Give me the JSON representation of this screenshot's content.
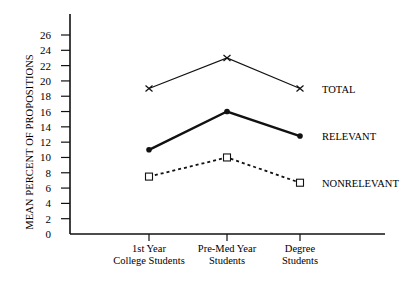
{
  "chart_data": {
    "type": "line",
    "title": "",
    "xlabel": "",
    "ylabel": "MEAN PERCENT OF PROPOSITIONS",
    "categories": [
      [
        "1st Year",
        "College Students"
      ],
      [
        "Pre-Med Year",
        "Students"
      ],
      [
        "Degree",
        "Students"
      ]
    ],
    "category_labels": [
      "1st Year College Students",
      "Pre-Med Year Students",
      "Degree Students"
    ],
    "y_ticks": [
      0,
      2,
      4,
      6,
      8,
      10,
      12,
      14,
      16,
      18,
      20,
      22,
      24,
      26
    ],
    "ylim": [
      0,
      28
    ],
    "grid": false,
    "legend_position": "inline-right",
    "series": [
      {
        "name": "TOTAL",
        "values": [
          19,
          23,
          19
        ],
        "marker": "x",
        "line_style": "solid-thin",
        "color": "#111111"
      },
      {
        "name": "RELEVANT",
        "values": [
          11,
          16,
          12.8
        ],
        "marker": "dot",
        "line_style": "solid-thick",
        "color": "#111111"
      },
      {
        "name": "NONRELEVANT",
        "values": [
          7.5,
          10,
          6.7
        ],
        "marker": "square",
        "line_style": "dashed",
        "color": "#111111"
      }
    ]
  }
}
